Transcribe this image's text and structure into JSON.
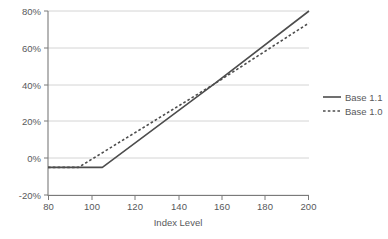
{
  "chart_data": {
    "type": "line",
    "title": "",
    "xlabel": "Index Level",
    "ylabel": "",
    "xlim": [
      80,
      200
    ],
    "ylim": [
      -0.2,
      0.8
    ],
    "grid": true,
    "legend_position": "right",
    "x_ticks": [
      80,
      100,
      120,
      140,
      160,
      180,
      200
    ],
    "x_tick_labels": [
      "80",
      "100",
      "120",
      "140",
      "160",
      "180",
      "200"
    ],
    "y_ticks": [
      -0.2,
      0.0,
      0.2,
      0.4,
      0.6,
      0.8
    ],
    "y_tick_labels": [
      "-20%",
      "0%",
      "20%",
      "40%",
      "60%",
      "80%"
    ],
    "series": [
      {
        "name": "Base 1.1",
        "style": "solid",
        "color": "#4d4d4d",
        "x": [
          80,
          105,
          156,
          200
        ],
        "values": [
          -0.05,
          -0.05,
          0.4,
          0.8
        ]
      },
      {
        "name": "Base 1.0",
        "style": "dashed",
        "color": "#4d4d4d",
        "x": [
          80,
          94,
          156,
          200
        ],
        "values": [
          -0.05,
          -0.05,
          0.4,
          0.735
        ]
      }
    ]
  },
  "legend": {
    "items": [
      {
        "label": "Base 1.1",
        "style": "solid"
      },
      {
        "label": "Base 1.0",
        "style": "dashed"
      }
    ]
  },
  "axes": {
    "x_title": "Index Level"
  }
}
